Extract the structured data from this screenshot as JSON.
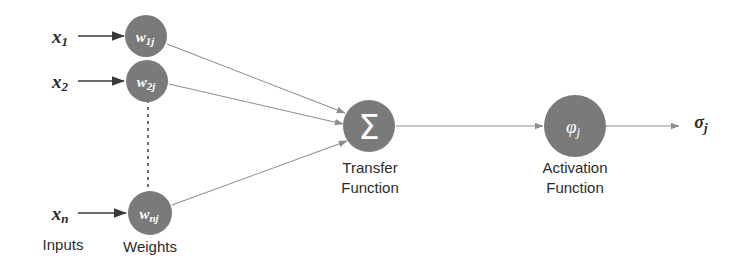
{
  "diagram": {
    "colors": {
      "node_fill": "#7a7a7a",
      "node_text": "#ffffff",
      "edge_light": "#8d8d8d",
      "edge_dark": "#3a3a3a",
      "label_text": "#2b2b2b",
      "background": "#ffffff"
    },
    "inputs": {
      "group_label": "Inputs",
      "items": [
        {
          "label": "x",
          "subscript": "1"
        },
        {
          "label": "x",
          "subscript": "2"
        },
        {
          "label": "x",
          "subscript": "n"
        }
      ]
    },
    "weights": {
      "group_label": "Weights",
      "nodes": [
        {
          "label": "w",
          "subscript": "1j"
        },
        {
          "label": "w",
          "subscript": "2j"
        },
        {
          "label": "w",
          "subscript": "nj"
        }
      ]
    },
    "transfer": {
      "glyph": "Σ",
      "glyph_name": "sigma-summation",
      "label_line1": "Transfer",
      "label_line2": "Function"
    },
    "activation": {
      "glyph": "φ",
      "glyph_subscript": "j",
      "glyph_name": "phi-activation",
      "label_line1": "Activation",
      "label_line2": "Function"
    },
    "output": {
      "label": "σ",
      "subscript": "j"
    }
  }
}
